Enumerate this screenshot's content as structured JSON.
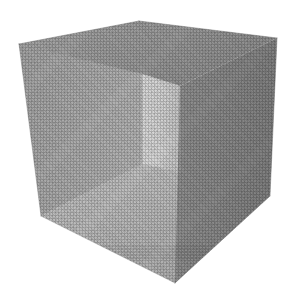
{
  "scene": {
    "title": "Open cube interior render",
    "object_name": "open-box-cube",
    "projection": "three-point perspective",
    "background_color": "#ffffff",
    "canvas": {
      "width": 294,
      "height": 307
    },
    "caption": ""
  },
  "geometry": {
    "silhouette": [
      {
        "name": "top-left-outer",
        "x": 19,
        "y": 44
      },
      {
        "name": "top-near-apex",
        "x": 139,
        "y": 21
      },
      {
        "name": "top-right-outer",
        "x": 277,
        "y": 38
      },
      {
        "name": "bottom-right-outer",
        "x": 270,
        "y": 196
      },
      {
        "name": "bottom-near-apex",
        "x": 175,
        "y": 283
      },
      {
        "name": "bottom-left-outer",
        "x": 41,
        "y": 216
      }
    ],
    "interior_vertices": [
      {
        "name": "back-top-left",
        "x": 142,
        "y": 74
      },
      {
        "name": "back-top-right",
        "x": 180,
        "y": 86
      },
      {
        "name": "back-bottom-left",
        "x": 142,
        "y": 164
      },
      {
        "name": "back-bottom-right",
        "x": 180,
        "y": 172
      }
    ]
  },
  "faces": [
    {
      "id": "top-inner",
      "label": "Top interior face",
      "fill": "#9d9d9d",
      "fill_dark": "#8f8f8f",
      "points": "19,44 139,21 277,38 180,86 142,74"
    },
    {
      "id": "left-inner",
      "label": "Left interior wall",
      "fill": "#a9a9a9",
      "fill_dark": "#9c9c9c",
      "points": "19,44 142,74 142,164 41,216"
    },
    {
      "id": "back-inner",
      "label": "Back interior wall",
      "fill": "#d4d4d4",
      "fill_dark": "#c4c4c4",
      "points": "142,74 180,86 180,172 142,164"
    },
    {
      "id": "bottom-inner",
      "label": "Bottom interior floor",
      "fill": "#bcbcbc",
      "fill_dark": "#adadad",
      "points": "41,216 142,164 180,172 175,283"
    },
    {
      "id": "right-outer",
      "label": "Right exterior face",
      "fill": "#8a8a8a",
      "fill_dark": "#7d7d7d",
      "points": "180,86 277,38 270,196 175,283"
    }
  ],
  "edges": [
    {
      "id": "top-left-ridge",
      "label": "Top left outer ridge",
      "x1": 19,
      "y1": 44,
      "x2": 139,
      "y2": 21,
      "stroke": "#7f7f7f"
    },
    {
      "id": "top-right-ridge",
      "label": "Top right outer ridge",
      "x1": 139,
      "y1": 21,
      "x2": 277,
      "y2": 38,
      "stroke": "#7f7f7f"
    },
    {
      "id": "left-vertical",
      "label": "Left outer vertical edge",
      "x1": 19,
      "y1": 44,
      "x2": 41,
      "y2": 216,
      "stroke": "#8a8a8a"
    },
    {
      "id": "right-vertical",
      "label": "Right outer vertical edge",
      "x1": 277,
      "y1": 38,
      "x2": 270,
      "y2": 196,
      "stroke": "#7a7a7a"
    },
    {
      "id": "bottom-left-ridge",
      "label": "Bottom left outer ridge",
      "x1": 41,
      "y1": 216,
      "x2": 175,
      "y2": 283,
      "stroke": "#9a9a9a"
    },
    {
      "id": "bottom-right-ridge",
      "label": "Bottom right outer ridge",
      "x1": 175,
      "y1": 283,
      "x2": 270,
      "y2": 196,
      "stroke": "#7a7a7a"
    },
    {
      "id": "near-top-corner",
      "label": "Near top corner drop",
      "x1": 139,
      "y1": 21,
      "x2": 180,
      "y2": 86,
      "stroke": "#8c8c8c"
    },
    {
      "id": "inner-back-left",
      "label": "Inner back left corner",
      "x1": 142,
      "y1": 74,
      "x2": 142,
      "y2": 164,
      "stroke": "#b6b6b6"
    },
    {
      "id": "inner-back-right",
      "label": "Inner back right corner",
      "x1": 180,
      "y1": 86,
      "x2": 180,
      "y2": 172,
      "stroke": "#a2a2a2"
    },
    {
      "id": "inner-ceiling-left",
      "label": "Inner ceiling left seam",
      "x1": 19,
      "y1": 44,
      "x2": 142,
      "y2": 74,
      "stroke": "#8f8f8f"
    },
    {
      "id": "inner-ceiling-back",
      "label": "Inner ceiling back seam",
      "x1": 142,
      "y1": 74,
      "x2": 180,
      "y2": 86,
      "stroke": "#b0b0b0"
    },
    {
      "id": "inner-floor-left",
      "label": "Inner floor left seam",
      "x1": 41,
      "y1": 216,
      "x2": 142,
      "y2": 164,
      "stroke": "#adadad"
    },
    {
      "id": "inner-floor-back",
      "label": "Inner floor back seam",
      "x1": 142,
      "y1": 164,
      "x2": 180,
      "y2": 172,
      "stroke": "#b4b4b4"
    },
    {
      "id": "near-bottom-corner",
      "label": "Near bottom corner rise",
      "x1": 180,
      "y1": 172,
      "x2": 175,
      "y2": 283,
      "stroke": "#8e8e8e"
    }
  ]
}
